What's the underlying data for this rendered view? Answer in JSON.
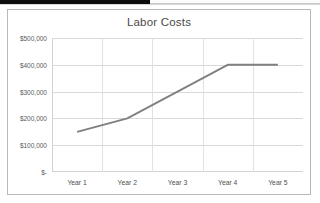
{
  "window": {
    "top_strip_label": ""
  },
  "chart_data": {
    "type": "line",
    "title": "Labor Costs",
    "xlabel": "",
    "ylabel": "",
    "categories": [
      "Year 1",
      "Year 2",
      "Year 3",
      "Year 4",
      "Year 5"
    ],
    "series": [
      {
        "name": "Labor Costs",
        "values": [
          150000,
          200000,
          300000,
          400000,
          400000
        ],
        "color": "#808080"
      }
    ],
    "ylim": [
      0,
      500000
    ],
    "ytick_values": [
      500000,
      400000,
      300000,
      200000,
      100000,
      0
    ],
    "ytick_labels": [
      "$500,000",
      "$400,000",
      "$300,000",
      "$200,000",
      "$100,000",
      "$-"
    ],
    "grid": true,
    "legend": "none",
    "colors": {
      "line": "#808080",
      "gridline": "#d9d9d9",
      "axis": "#d2d2d2",
      "frame": "#b9b9b9",
      "title_text": "#4a4a4a",
      "tick_text": "#5a5a5a",
      "plot_background": "#ffffff"
    }
  }
}
